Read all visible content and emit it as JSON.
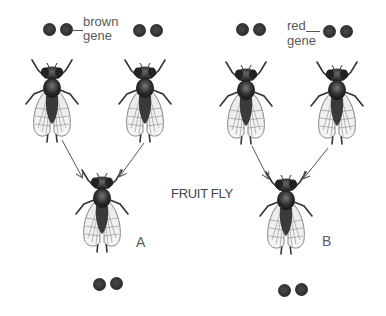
{
  "title": "FRUIT FLY",
  "parents_left": {
    "gene_label_line1": "brown",
    "gene_label_line2": "gene",
    "fly1_dots": [
      "dark",
      "dark"
    ],
    "fly2_dots": [
      "dark",
      "dark"
    ]
  },
  "parents_right": {
    "gene_label_line1": "red",
    "gene_label_line2": "gene",
    "fly1_dots": [
      "dark",
      "dark"
    ],
    "fly2_dots": [
      "dark",
      "dark"
    ]
  },
  "offspring": [
    {
      "label": "A",
      "dots": [
        "dark",
        "dark"
      ]
    },
    {
      "label": "B",
      "dots": [
        "dark",
        "dark"
      ]
    }
  ],
  "colors": {
    "dot": "#2b2b2b",
    "text": "#555555",
    "arrow": "#555555"
  }
}
